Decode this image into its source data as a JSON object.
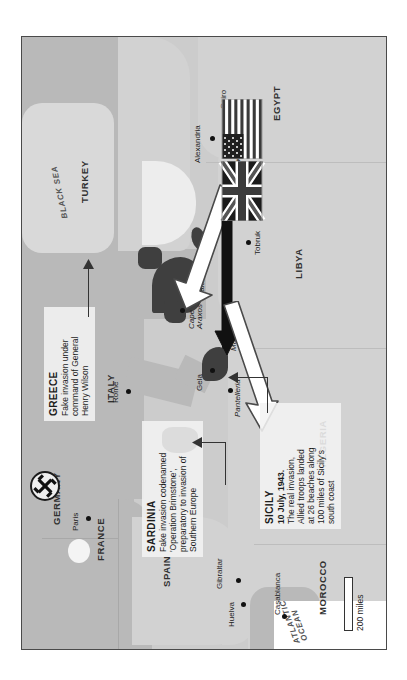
{
  "map": {
    "title": "Operation Mincemeat deception map, Mediterranean 1943",
    "scale_bar": {
      "label": "200 miles"
    },
    "colors": {
      "sea": "#ededed",
      "land": "#b9b9b9",
      "land_light": "#d2d2d2",
      "target_highlight": "#3f3f3f",
      "frame": "#4a4a4a",
      "callout_bg": "#f2f2f2",
      "arrow_fake": "#ffffff",
      "arrow_real": "#111111"
    },
    "seas": [
      {
        "name": "BLACK SEA"
      },
      {
        "name": "ATLANTIC\nOCEAN"
      }
    ],
    "countries": [
      {
        "name": "GERMANY"
      },
      {
        "name": "FRANCE"
      },
      {
        "name": "SPAIN"
      },
      {
        "name": "ITALY"
      },
      {
        "name": "TURKEY"
      },
      {
        "name": "MOROCCO"
      },
      {
        "name": "ALGERIA"
      },
      {
        "name": "LIBYA"
      },
      {
        "name": "EGYPT"
      }
    ],
    "cities": [
      {
        "name": "Paris"
      },
      {
        "name": "Rome"
      },
      {
        "name": "Huelva"
      },
      {
        "name": "Gibraltar"
      },
      {
        "name": "Casablanca"
      },
      {
        "name": "Gela"
      },
      {
        "name": "Kalamata"
      },
      {
        "name": "Tobruk"
      },
      {
        "name": "El Alamein"
      },
      {
        "name": "Alexandria"
      },
      {
        "name": "Cairo"
      }
    ],
    "features": [
      {
        "name": "Malta"
      },
      {
        "name": "Pantelleria"
      },
      {
        "name": "Cape\nAraxos"
      }
    ],
    "flags": [
      {
        "name": "United Kingdom"
      },
      {
        "name": "United States"
      }
    ],
    "insignia": [
      {
        "name": "swastika"
      }
    ]
  },
  "callouts": {
    "greece": {
      "heading": "GREECE",
      "body": "Fake invasion under\ncommand of General\nHenry Wilson"
    },
    "sardinia": {
      "heading": "SARDINIA",
      "body": "Fake invasion codenamed\n'Operation Brimstone',\npreparatory to invasion of\nSouthern Europe"
    },
    "sicily": {
      "heading": "SICILY",
      "subheading": "10 July, 1943.",
      "body": "The real invasion,\nAllied troops landed\nat 26 beaches along\n100 miles of Sicily's\nsouth coast"
    }
  }
}
